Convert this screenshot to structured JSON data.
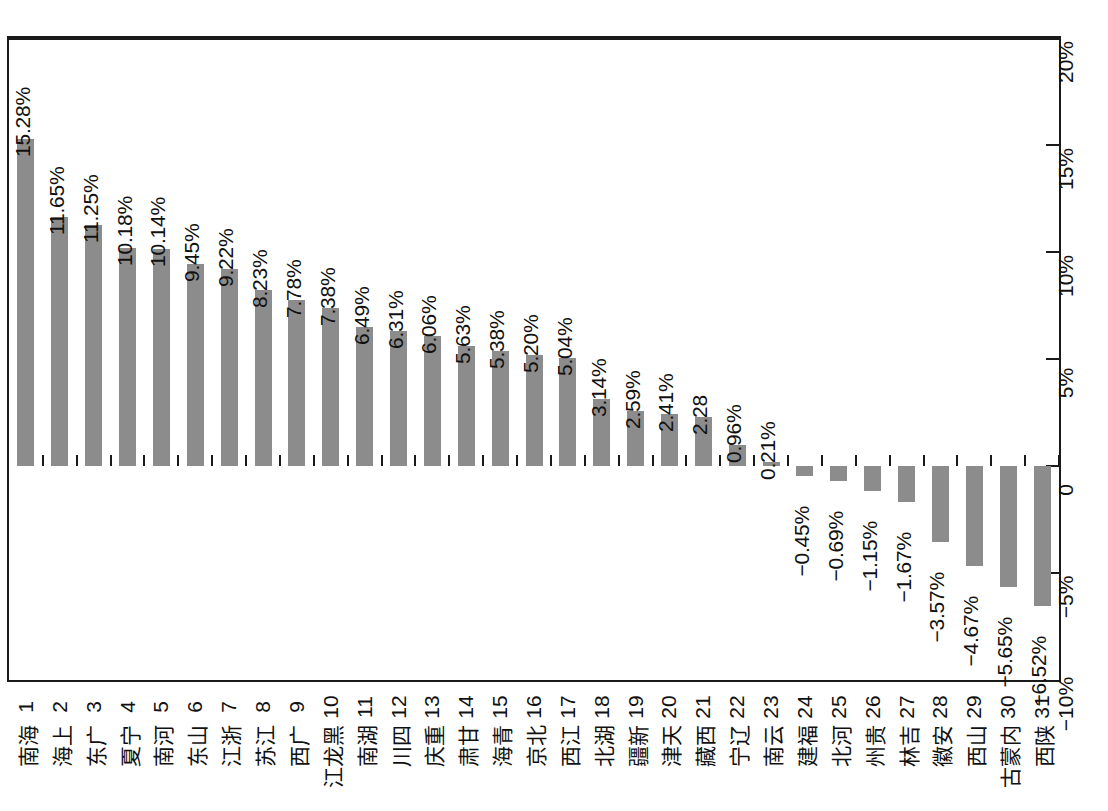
{
  "chart_data": {
    "type": "bar",
    "title": "",
    "subtitle": "",
    "xlabel": "",
    "ylabel": "",
    "orientation": "vertical",
    "grid": false,
    "legend": null,
    "ylim": [
      -10,
      20
    ],
    "y_ticks": [
      20,
      15,
      10,
      5,
      0,
      -5,
      -10
    ],
    "y_tick_labels": [
      "20%",
      "15%",
      "10%",
      "5%",
      "0",
      "-5%",
      "-10%"
    ],
    "bar_color": "#8c8c8c",
    "axis_color": "#1a1a1a",
    "ranks": [
      "1",
      "2",
      "3",
      "4",
      "5",
      "6",
      "7",
      "8",
      "9",
      "10",
      "11",
      "12",
      "13",
      "14",
      "15",
      "16",
      "17",
      "18",
      "19",
      "20",
      "21",
      "22",
      "23",
      "24",
      "25",
      "26",
      "27",
      "28",
      "29",
      "30",
      "31"
    ],
    "categories": [
      "海南",
      "上海",
      "广东",
      "宁夏",
      "河南",
      "山东",
      "浙江",
      "江苏",
      "广西",
      "黑龙江",
      "湖南",
      "四川",
      "重庆",
      "甘肃",
      "青海",
      "北京",
      "江西",
      "湖北",
      "新疆",
      "天津",
      "西藏",
      "辽宁",
      "云南",
      "福建",
      "河北",
      "贵州",
      "吉林",
      "安徽",
      "山西",
      "内蒙古",
      "陕西"
    ],
    "values": [
      15.28,
      11.65,
      11.25,
      10.18,
      10.14,
      9.45,
      9.22,
      8.23,
      7.78,
      7.38,
      6.49,
      6.31,
      6.06,
      5.63,
      5.38,
      5.2,
      5.04,
      3.14,
      2.59,
      2.41,
      2.28,
      0.96,
      0.21,
      -0.45,
      -0.69,
      -1.15,
      -1.67,
      -3.57,
      -4.67,
      -5.65,
      -6.52
    ],
    "data_labels": [
      "15.28%",
      "11.65%",
      "11.25%",
      "10.18%",
      "10.14%",
      "9.45%",
      "9.22%",
      "8.23%",
      "7.78%",
      "7.38%",
      "6.49%",
      "6.31%",
      "6.06%",
      "5.63%",
      "5.38%",
      "5.20%",
      "5.04%",
      "3.14%",
      "2.59%",
      "2.41%",
      "2.28",
      "0.96%",
      "0.21%",
      "-0.45%",
      "-0.69%",
      "-1.15%",
      "-1.67%",
      "-3.57%",
      "-4.67%",
      "-5.65%",
      "-6.52%"
    ]
  }
}
